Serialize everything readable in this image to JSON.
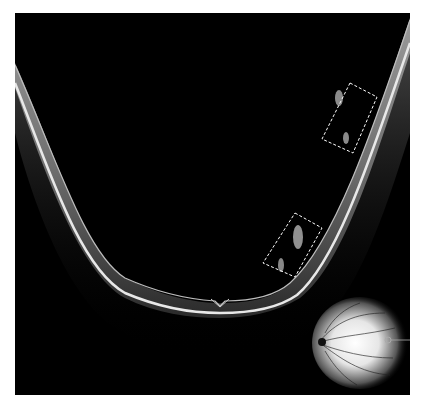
{
  "image": {
    "type": "OCT B-scan (retinal cross-section)",
    "background_color": "#000000",
    "page_background": "#ffffff",
    "annotation_color": "#ffffff"
  },
  "annotations": [
    {
      "id": "box-upper",
      "style": "dashed rectangle",
      "description": "upper dashed box on right retinal slope"
    },
    {
      "id": "box-lower",
      "style": "dashed rectangle",
      "description": "lower dashed box on right retinal slope"
    }
  ],
  "inset": {
    "description": "fundus image with scan line marker",
    "position": "bottom-right"
  }
}
